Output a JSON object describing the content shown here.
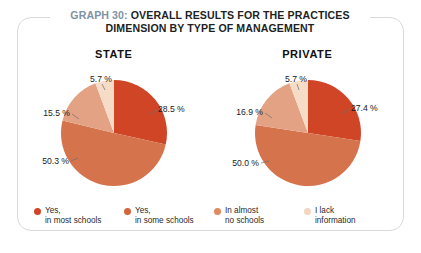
{
  "figure": {
    "title_prefix": "GRAPH 30:",
    "title_line1": "OVERALL RESULTS FOR THE PRACTICES",
    "title_line2": "DIMENSION BY TYPE OF MANAGEMENT",
    "prefix_color": "#7e93a3",
    "frame_color": "#d9d9d9",
    "background": "#ffffff"
  },
  "legend": {
    "items": [
      {
        "label": "Yes,\nin most schools",
        "color": "#CF4526"
      },
      {
        "label": "Yes,\nin some schools",
        "color": "#D4653A"
      },
      {
        "label": "In almost\nno schools",
        "color": "#E08A5E"
      },
      {
        "label": "I lack\ninformation",
        "color": "#F3D6C0"
      }
    ]
  },
  "chart_data": [
    {
      "type": "pie",
      "title": "STATE",
      "categories": [
        "Yes, in most schools",
        "Yes, in some schools",
        "In almost no schools",
        "I lack information"
      ],
      "values": [
        28.5,
        50.3,
        15.5,
        5.7
      ],
      "labels": [
        "28.5 %",
        "50.3 %",
        "15.5 %",
        "5.7 %"
      ],
      "colors": [
        "#CF4526",
        "#D4734C",
        "#E3A284",
        "#F6DCC6"
      ],
      "legend": "bottom",
      "grid": false
    },
    {
      "type": "pie",
      "title": "PRIVATE",
      "categories": [
        "Yes, in most schools",
        "Yes, in some schools",
        "In almost no schools",
        "I lack information"
      ],
      "values": [
        27.4,
        50.0,
        16.9,
        5.7
      ],
      "labels": [
        "27.4 %",
        "50.0 %",
        "16.9 %",
        "5.7 %"
      ],
      "colors": [
        "#CF4526",
        "#D4734C",
        "#E3A284",
        "#F6DCC6"
      ],
      "legend": "bottom",
      "grid": false
    }
  ]
}
